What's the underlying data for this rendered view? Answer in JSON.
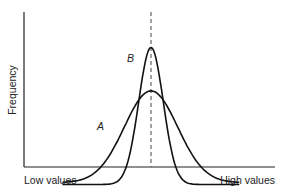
{
  "chart_data": {
    "type": "line",
    "title": "",
    "xlabel": "",
    "ylabel": "Frequency",
    "x_tick_labels": {
      "left": "Low values",
      "right": "High values"
    },
    "grid": false,
    "reference_line": {
      "style": "dashed",
      "orientation": "vertical",
      "position": "mean"
    },
    "x_range": [
      -4,
      4
    ],
    "y_range": [
      0,
      1
    ],
    "series": [
      {
        "name": "A",
        "label": "A",
        "distribution": "normal",
        "mean": 0,
        "relative_spread": "wide",
        "sd": 1.2,
        "relative_peak": 0.62
      },
      {
        "name": "B",
        "label": "B",
        "distribution": "normal",
        "mean": 0,
        "relative_spread": "narrow",
        "sd": 0.55,
        "relative_peak": 0.9
      }
    ]
  }
}
